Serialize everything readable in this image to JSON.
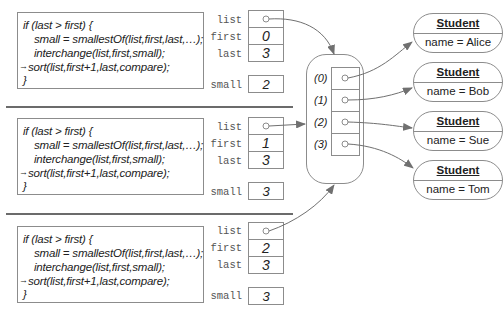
{
  "frames": [
    {
      "code": [
        "if (last > first) {",
        "small = smallestOf(list,first,last,…);",
        "interchange(list,first,small);",
        "sort(list,first+1,last,compare);",
        "}"
      ],
      "current_line_marker": "→",
      "vars": {
        "list_label": "list",
        "list_value": "○",
        "first_label": "first",
        "first_value": "0",
        "last_label": "last",
        "last_value": "3",
        "small_label": "small",
        "small_value": "2"
      }
    },
    {
      "code": [
        "if (last > first) {",
        "small = smallestOf(list,first,last,…);",
        "interchange(list,first,small);",
        "sort(list,first+1,last,compare);",
        "}"
      ],
      "current_line_marker": "→",
      "vars": {
        "list_label": "list",
        "list_value": "○",
        "first_label": "first",
        "first_value": "1",
        "last_label": "last",
        "last_value": "3",
        "small_label": "small",
        "small_value": "3"
      }
    },
    {
      "code": [
        "if (last > first) {",
        "small = smallestOf(list,first,last,…);",
        "interchange(list,first,small);",
        "sort(list,first+1,last,compare);",
        "}"
      ],
      "current_line_marker": "→",
      "vars": {
        "list_label": "list",
        "list_value": "○",
        "first_label": "first",
        "first_value": "2",
        "last_label": "last",
        "last_value": "3",
        "small_label": "small",
        "small_value": "3"
      }
    }
  ],
  "array": {
    "indices": [
      "(0)",
      "(1)",
      "(2)",
      "(3)"
    ]
  },
  "students": [
    {
      "title": "Student",
      "field": "name = Alice"
    },
    {
      "title": "Student",
      "field": "name = Bob"
    },
    {
      "title": "Student",
      "field": "name = Sue"
    },
    {
      "title": "Student",
      "field": "name = Tom"
    }
  ],
  "colors": {
    "line": "#8c8c8c",
    "arrow": "#707070",
    "separator": "#6b6b6b"
  }
}
